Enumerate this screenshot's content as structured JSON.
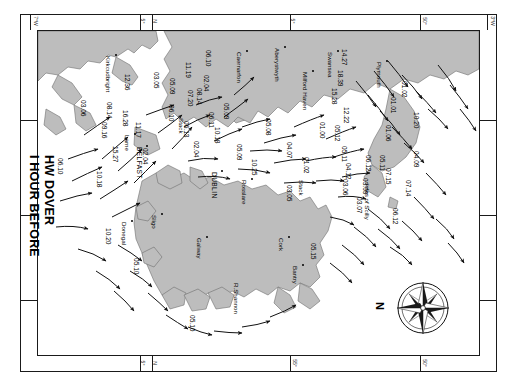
{
  "chart": {
    "title_line1": "I HOUR BEFORE",
    "title_line2": "HW DOVER",
    "type": "tidal-stream-atlas",
    "north_label": "N",
    "sea_color": "#ffffff",
    "land_color": "#b9b9b9",
    "outline_color": "#6a6a6a",
    "ink_color": "#1a1a1a"
  },
  "graticule": {
    "top_labels": [
      {
        "text": "7°W",
        "x": 30
      },
      {
        "text": "5°",
        "x": 140
      },
      {
        "text": "N",
        "x": 152
      },
      {
        "text": "5°",
        "x": 290
      },
      {
        "text": "50°",
        "x": 420
      },
      {
        "text": "3°W",
        "x": 487
      }
    ],
    "bottom_labels": [
      {
        "text": "5°",
        "x": 140
      },
      {
        "text": "N",
        "x": 152
      },
      {
        "text": "55°",
        "x": 290
      },
      {
        "text": "50°",
        "x": 420
      }
    ]
  },
  "places": [
    {
      "name": "Kirkcudbright",
      "x": 112,
      "y": 56,
      "caps": false,
      "dot": true
    },
    {
      "name": "Caernarfon",
      "x": 243,
      "y": 52,
      "caps": false,
      "dot": true
    },
    {
      "name": "Aberystwyth",
      "x": 281,
      "y": 48,
      "caps": false,
      "dot": true
    },
    {
      "name": "Milford Haven",
      "x": 309,
      "y": 72,
      "caps": false,
      "dot": true
    },
    {
      "name": "Swansea",
      "x": 334,
      "y": 52,
      "caps": false,
      "dot": true
    },
    {
      "name": "Plymouth",
      "x": 383,
      "y": 62,
      "caps": false,
      "dot": true
    },
    {
      "name": "Larne",
      "x": 131,
      "y": 135,
      "caps": false,
      "dot": true
    },
    {
      "name": "BELFAST",
      "x": 143,
      "y": 147,
      "caps": true,
      "dot": true
    },
    {
      "name": "Stack",
      "x": 185,
      "y": 118,
      "caps": false,
      "dot": false
    },
    {
      "name": "DUBLIN",
      "x": 218,
      "y": 172,
      "caps": true,
      "dot": true
    },
    {
      "name": "Rosslare",
      "x": 248,
      "y": 180,
      "caps": false,
      "dot": true
    },
    {
      "name": "Stack",
      "x": 305,
      "y": 180,
      "caps": false,
      "dot": false
    },
    {
      "name": "Isles of Scilly",
      "x": 371,
      "y": 184,
      "caps": false,
      "dot": false
    },
    {
      "name": "Donegal",
      "x": 128,
      "y": 222,
      "caps": false,
      "dot": true
    },
    {
      "name": "Sligo",
      "x": 158,
      "y": 215,
      "caps": false,
      "dot": true
    },
    {
      "name": "Galway",
      "x": 203,
      "y": 238,
      "caps": false,
      "dot": true
    },
    {
      "name": "R.Shannon",
      "x": 240,
      "y": 283,
      "caps": false,
      "dot": false
    },
    {
      "name": "Cork",
      "x": 285,
      "y": 238,
      "caps": false,
      "dot": true
    },
    {
      "name": "Bantry",
      "x": 299,
      "y": 266,
      "caps": false,
      "dot": true
    }
  ],
  "tidal_rates": [
    {
      "v": "06.10",
      "x": 64,
      "y": 158
    },
    {
      "v": "03.06",
      "x": 87,
      "y": 100
    },
    {
      "v": "15.27",
      "x": 119,
      "y": 146
    },
    {
      "v": "10.18",
      "x": 103,
      "y": 171
    },
    {
      "v": "09.16",
      "x": 108,
      "y": 122
    },
    {
      "v": "08.14",
      "x": 113,
      "y": 102
    },
    {
      "v": "12.36",
      "x": 131,
      "y": 74
    },
    {
      "v": "16.28",
      "x": 129,
      "y": 110
    },
    {
      "v": "11.17",
      "x": 142,
      "y": 122
    },
    {
      "v": "02.04",
      "x": 149,
      "y": 148
    },
    {
      "v": "03.05",
      "x": 160,
      "y": 72
    },
    {
      "v": "05.09",
      "x": 176,
      "y": 78
    },
    {
      "v": "06.10",
      "x": 175,
      "y": 105
    },
    {
      "v": "11.19",
      "x": 192,
      "y": 62
    },
    {
      "v": "07.20",
      "x": 194,
      "y": 90
    },
    {
      "v": "06.13",
      "x": 190,
      "y": 121
    },
    {
      "v": "02.04",
      "x": 200,
      "y": 141
    },
    {
      "v": "08.14",
      "x": 203,
      "y": 88
    },
    {
      "v": "02.04",
      "x": 210,
      "y": 75
    },
    {
      "v": "06.10",
      "x": 212,
      "y": 50
    },
    {
      "v": "10.18",
      "x": 221,
      "y": 127
    },
    {
      "v": "06.11",
      "x": 215,
      "y": 112
    },
    {
      "v": "05.09",
      "x": 230,
      "y": 103
    },
    {
      "v": "05.09",
      "x": 243,
      "y": 144
    },
    {
      "v": "10.25",
      "x": 258,
      "y": 159
    },
    {
      "v": "05.08",
      "x": 272,
      "y": 119
    },
    {
      "v": "04.07",
      "x": 293,
      "y": 142
    },
    {
      "v": "01.02",
      "x": 310,
      "y": 157
    },
    {
      "v": "03.05",
      "x": 293,
      "y": 185
    },
    {
      "v": "05.15",
      "x": 317,
      "y": 243
    },
    {
      "v": "14.27",
      "x": 348,
      "y": 49
    },
    {
      "v": "18.39",
      "x": 344,
      "y": 70
    },
    {
      "v": "15.28",
      "x": 338,
      "y": 88
    },
    {
      "v": "12.22",
      "x": 350,
      "y": 107
    },
    {
      "v": "05.12",
      "x": 341,
      "y": 125
    },
    {
      "v": "01.00",
      "x": 326,
      "y": 122
    },
    {
      "v": "05.11",
      "x": 348,
      "y": 146
    },
    {
      "v": "04.12",
      "x": 352,
      "y": 163
    },
    {
      "v": "03.06",
      "x": 349,
      "y": 179
    },
    {
      "v": "01.02",
      "x": 408,
      "y": 81
    },
    {
      "v": "01.01",
      "x": 397,
      "y": 97
    },
    {
      "v": "10.20",
      "x": 420,
      "y": 112
    },
    {
      "v": "01.06",
      "x": 392,
      "y": 125
    },
    {
      "v": "06.12",
      "x": 372,
      "y": 155
    },
    {
      "v": "03.09",
      "x": 369,
      "y": 178
    },
    {
      "v": "03.07",
      "x": 363,
      "y": 197
    },
    {
      "v": "05.11",
      "x": 386,
      "y": 155
    },
    {
      "v": "07.15",
      "x": 392,
      "y": 168
    },
    {
      "v": "04.09",
      "x": 420,
      "y": 151
    },
    {
      "v": "07.14",
      "x": 412,
      "y": 180
    },
    {
      "v": "06.12",
      "x": 399,
      "y": 208
    },
    {
      "v": "10.20",
      "x": 112,
      "y": 228
    },
    {
      "v": "05.10",
      "x": 140,
      "y": 258
    },
    {
      "v": "05.10",
      "x": 196,
      "y": 315
    }
  ],
  "arrow_count": 68
}
